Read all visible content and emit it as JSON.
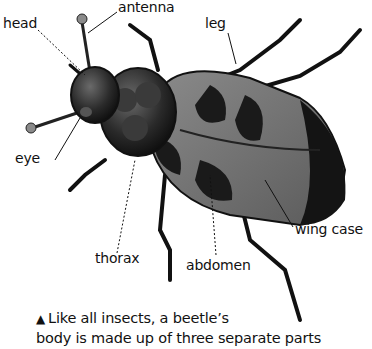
{
  "diagram": {
    "labels": {
      "antenna": "antenna",
      "head": "head",
      "leg": "leg",
      "eye": "eye",
      "thorax": "thorax",
      "abdomen": "abdomen",
      "wing_case": "wing case"
    },
    "caption": {
      "marker": "▲",
      "line1": "Like all insects, a beetle’s",
      "line2": "body is made up of three separate parts"
    }
  }
}
